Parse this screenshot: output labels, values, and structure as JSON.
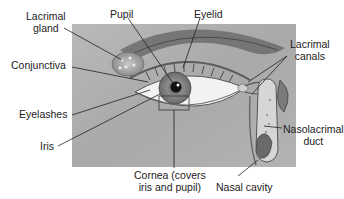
{
  "diagram": {
    "labels": {
      "lacrimal_gland": [
        "Lacrimal",
        "gland"
      ],
      "pupil": "Pupil",
      "eyelid": "Eyelid",
      "lacrimal_canals": [
        "Lacrimal",
        "canals"
      ],
      "conjunctiva": "Conjunctiva",
      "eyelashes": "Eyelashes",
      "iris": "Iris",
      "nasolacrimal_duct": [
        "Nasolacrimal",
        "duct"
      ],
      "cornea": [
        "Cornea (covers",
        "iris and pupil)"
      ],
      "nasal_cavity": "Nasal cavity"
    }
  }
}
